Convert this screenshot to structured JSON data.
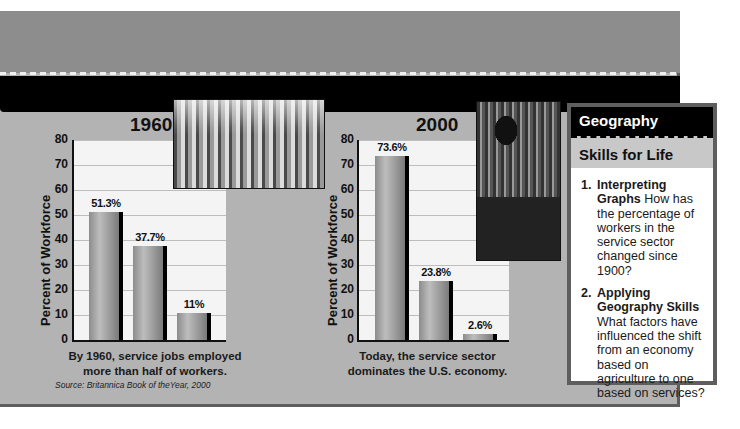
{
  "colors": {
    "panel_bg": "#b3b3b3",
    "header_band": "#8d8d8d",
    "black_band": "#000000",
    "plot_bg": "#f4f4f4",
    "bar": "#a6a6a6",
    "bar_shadow": "#000000"
  },
  "chart_data": [
    {
      "type": "bar",
      "title": "1960",
      "categories": [
        "Service",
        "Industry",
        "Agriculture"
      ],
      "values": [
        51.3,
        37.7,
        11
      ],
      "value_labels": [
        "51.3%",
        "37.7%",
        "11%"
      ],
      "xlabel": "",
      "ylabel": "Percent of Workforce",
      "ylim": [
        0,
        80
      ],
      "yticks": [
        0,
        10,
        20,
        30,
        40,
        50,
        60,
        70,
        80
      ],
      "grid": true,
      "caption": "By 1960, service jobs employed more than half of workers."
    },
    {
      "type": "bar",
      "title": "2000",
      "categories": [
        "Service",
        "Industry",
        "Agriculture"
      ],
      "values": [
        73.6,
        23.8,
        2.6
      ],
      "value_labels": [
        "73.6%",
        "23.8%",
        "2.6%"
      ],
      "xlabel": "",
      "ylabel": "Percent of Workforce",
      "ylim": [
        0,
        80
      ],
      "yticks": [
        0,
        10,
        20,
        30,
        40,
        50,
        60,
        70,
        80
      ],
      "grid": true,
      "caption": "Today, the service sector dominates the U.S. economy."
    }
  ],
  "charts": {
    "c1": {
      "title": "1960",
      "ylabel": "Percent of Workforce",
      "ticks": [
        "80",
        "70",
        "60",
        "50",
        "40",
        "30",
        "20",
        "10",
        "0"
      ],
      "labels": [
        "51.3%",
        "37.7%",
        "11%"
      ],
      "caption_line1": "By 1960, service jobs employed",
      "caption_line2": "more than half of workers."
    },
    "c2": {
      "title": "2000",
      "ylabel": "Percent of Workforce",
      "ticks": [
        "80",
        "70",
        "60",
        "50",
        "40",
        "30",
        "20",
        "10",
        "0"
      ],
      "labels": [
        "73.6%",
        "23.8%",
        "2.6%"
      ],
      "caption_line1": "Today, the service sector",
      "caption_line2": "dominates the U.S. economy."
    }
  },
  "source": "Source: Britannica Book of theYear, 2000",
  "photos": {
    "p1": "supermarket-checkout-photo",
    "p2": "sound-engineer-mixing-console-photo"
  },
  "skills": {
    "header": "Geography",
    "subheader": "Skills for Life",
    "items": [
      {
        "num": "1.",
        "title": "Interpreting Graphs",
        "text": "How has the percentage of workers in the service sector changed since 1900?"
      },
      {
        "num": "2.",
        "title": "Applying Geography Skills",
        "text": "What factors have influenced the shift from an economy based on agriculture to one based on services?"
      }
    ]
  }
}
